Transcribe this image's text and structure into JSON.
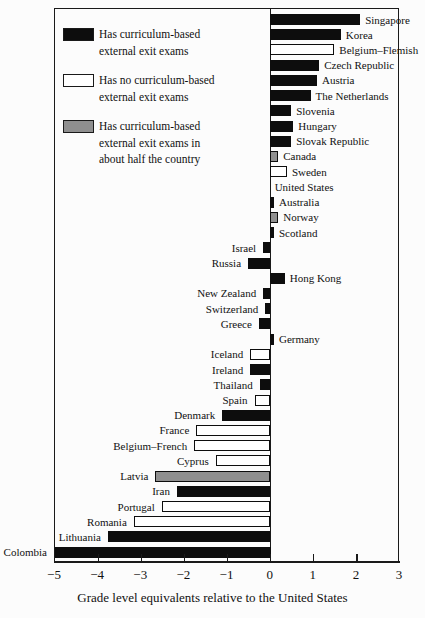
{
  "colors": {
    "bar_filled": "#0d0d0d",
    "bar_empty": "#ffffff",
    "bar_half": "#8f8f8f",
    "axis": "#1a1a1a",
    "background": "#fcfcfc"
  },
  "chart_data": {
    "type": "bar",
    "orientation": "horizontal",
    "title": "",
    "xlabel": "Grade level equivalents relative to the United States",
    "ylabel": "",
    "xlim": [
      -5,
      3
    ],
    "grid": false,
    "legend_position": "top-left-inside",
    "tick_values": [
      -5,
      -4,
      -3,
      -2,
      -1,
      0,
      1,
      2,
      3
    ],
    "tick_labels": [
      "−5",
      "−4",
      "−3",
      "−2",
      "−1",
      "0",
      "1",
      "2",
      "3"
    ],
    "legend": [
      {
        "key": "yes",
        "color": "#0d0d0d",
        "lines": [
          "Has curriculum-based",
          "external exit exams"
        ]
      },
      {
        "key": "no",
        "color": "#ffffff",
        "lines": [
          "Has no curriculum-based",
          "external exit exams"
        ]
      },
      {
        "key": "half",
        "color": "#8f8f8f",
        "lines": [
          "Has curriculum-based",
          "external exit exams in",
          "about half the country"
        ]
      }
    ],
    "bars": [
      {
        "country": "Singapore",
        "value": 2.1,
        "exam": "yes"
      },
      {
        "country": "Korea",
        "value": 1.65,
        "exam": "yes"
      },
      {
        "country": "Belgium–Flemish",
        "value": 1.5,
        "exam": "no"
      },
      {
        "country": "Czech Republic",
        "value": 1.15,
        "exam": "yes"
      },
      {
        "country": "Austria",
        "value": 1.1,
        "exam": "yes"
      },
      {
        "country": "The Netherlands",
        "value": 0.95,
        "exam": "yes"
      },
      {
        "country": "Slovenia",
        "value": 0.5,
        "exam": "yes"
      },
      {
        "country": "Hungary",
        "value": 0.55,
        "exam": "yes"
      },
      {
        "country": "Slovak Republic",
        "value": 0.5,
        "exam": "yes"
      },
      {
        "country": "Canada",
        "value": 0.2,
        "exam": "half"
      },
      {
        "country": "Sweden",
        "value": 0.4,
        "exam": "no"
      },
      {
        "country": "United States",
        "value": 0,
        "exam": "none"
      },
      {
        "country": "Australia",
        "value": 0.1,
        "exam": "yes"
      },
      {
        "country": "Norway",
        "value": 0.2,
        "exam": "half"
      },
      {
        "country": "Scotland",
        "value": 0.1,
        "exam": "yes"
      },
      {
        "country": "Israel",
        "value": -0.15,
        "exam": "yes"
      },
      {
        "country": "Russia",
        "value": -0.5,
        "exam": "yes"
      },
      {
        "country": "Hong Kong",
        "value": 0.35,
        "exam": "yes"
      },
      {
        "country": "New Zealand",
        "value": -0.15,
        "exam": "yes"
      },
      {
        "country": "Switzerland",
        "value": -0.1,
        "exam": "yes"
      },
      {
        "country": "Greece",
        "value": -0.25,
        "exam": "yes"
      },
      {
        "country": "Germany",
        "value": 0.1,
        "exam": "yes"
      },
      {
        "country": "Iceland",
        "value": -0.45,
        "exam": "no"
      },
      {
        "country": "Ireland",
        "value": -0.45,
        "exam": "yes"
      },
      {
        "country": "Thailand",
        "value": -0.23,
        "exam": "yes"
      },
      {
        "country": "Spain",
        "value": -0.35,
        "exam": "no"
      },
      {
        "country": "Denmark",
        "value": -1.1,
        "exam": "yes"
      },
      {
        "country": "France",
        "value": -1.7,
        "exam": "no"
      },
      {
        "country": "Belgium–French",
        "value": -1.75,
        "exam": "no"
      },
      {
        "country": "Cyprus",
        "value": -1.25,
        "exam": "no"
      },
      {
        "country": "Latvia",
        "value": -2.65,
        "exam": "half"
      },
      {
        "country": "Iran",
        "value": -2.15,
        "exam": "yes"
      },
      {
        "country": "Portugal",
        "value": -2.5,
        "exam": "no"
      },
      {
        "country": "Romania",
        "value": -3.15,
        "exam": "no"
      },
      {
        "country": "Lithuania",
        "value": -3.75,
        "exam": "yes"
      },
      {
        "country": "Colombia",
        "value": -5.0,
        "exam": "yes"
      }
    ]
  }
}
